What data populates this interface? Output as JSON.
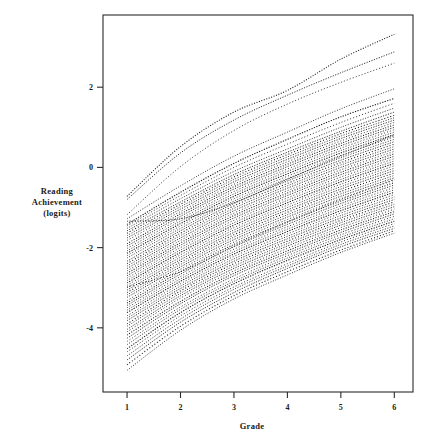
{
  "chart_data": {
    "type": "line",
    "title": "",
    "subtitle": "",
    "xlabel": "Grade",
    "ylabel": "Reading Achievement (logits)",
    "ylabel_lines": [
      "Reading",
      "Achievement",
      "(logits)"
    ],
    "xlim": [
      0.55,
      6.35
    ],
    "ylim": [
      -5.6,
      3.8
    ],
    "xticks": [
      1,
      2,
      3,
      4,
      5,
      6
    ],
    "xticklabels": [
      "1",
      "2",
      "3",
      "4",
      "5",
      "6"
    ],
    "yticks": [
      2,
      0,
      -2,
      -4
    ],
    "yticklabels": [
      "2",
      "0",
      "-2",
      "-4"
    ],
    "grid": false,
    "legend": null,
    "legend_position": "none",
    "line_style": "dotted",
    "line_color": "#111111",
    "x": [
      1,
      2,
      3,
      4,
      5,
      6
    ],
    "series": [
      {
        "name": "case-01",
        "values": [
          -0.72,
          0.52,
          1.38,
          1.92,
          2.7,
          3.32
        ]
      },
      {
        "name": "case-02",
        "values": [
          -0.8,
          0.36,
          1.18,
          1.8,
          2.36,
          2.88
        ]
      },
      {
        "name": "case-03",
        "values": [
          -1.18,
          0.02,
          0.92,
          1.58,
          2.12,
          2.6
        ]
      },
      {
        "name": "case-04",
        "values": [
          -1.28,
          -0.46,
          0.28,
          0.88,
          1.46,
          1.96
        ]
      },
      {
        "name": "case-05",
        "values": [
          -1.42,
          -0.62,
          0.1,
          0.7,
          1.26,
          1.72
        ]
      },
      {
        "name": "case-06",
        "values": [
          -1.46,
          -0.7,
          0.0,
          0.58,
          1.12,
          1.6
        ]
      },
      {
        "name": "case-07",
        "values": [
          -1.52,
          -0.78,
          -0.1,
          0.46,
          1.0,
          1.48
        ]
      },
      {
        "name": "case-08",
        "values": [
          -1.58,
          -0.86,
          -0.18,
          0.38,
          0.9,
          1.38
        ]
      },
      {
        "name": "case-09",
        "values": [
          -1.64,
          -0.92,
          -0.24,
          0.32,
          0.84,
          1.3
        ]
      },
      {
        "name": "case-10",
        "values": [
          -1.7,
          -0.98,
          -0.3,
          0.26,
          0.78,
          1.24
        ]
      },
      {
        "name": "case-11",
        "values": [
          -1.76,
          -1.04,
          -0.36,
          0.2,
          0.72,
          1.18
        ]
      },
      {
        "name": "case-12",
        "values": [
          -1.82,
          -1.1,
          -0.42,
          0.14,
          0.66,
          1.12
        ]
      },
      {
        "name": "case-13",
        "values": [
          -1.9,
          -1.16,
          -0.48,
          0.08,
          0.6,
          1.06
        ]
      },
      {
        "name": "case-14",
        "values": [
          -1.96,
          -1.22,
          -0.54,
          0.02,
          0.54,
          1.0
        ]
      },
      {
        "name": "case-15",
        "values": [
          -2.02,
          -1.28,
          -0.6,
          -0.04,
          0.48,
          0.94
        ]
      },
      {
        "name": "case-16",
        "values": [
          -2.08,
          -1.34,
          -0.66,
          -0.1,
          0.42,
          0.88
        ]
      },
      {
        "name": "case-17",
        "values": [
          -2.14,
          -1.4,
          -0.72,
          -0.16,
          0.36,
          0.82
        ]
      },
      {
        "name": "case-18",
        "values": [
          -2.2,
          -1.46,
          -0.78,
          -0.22,
          0.3,
          0.76
        ]
      },
      {
        "name": "case-19",
        "values": [
          -2.26,
          -1.52,
          -0.84,
          -0.28,
          0.24,
          0.7
        ]
      },
      {
        "name": "case-20",
        "values": [
          -2.34,
          -1.58,
          -0.9,
          -0.34,
          0.18,
          0.64
        ]
      },
      {
        "name": "case-21",
        "values": [
          -2.4,
          -1.64,
          -0.96,
          -0.4,
          0.12,
          0.58
        ]
      },
      {
        "name": "case-22",
        "values": [
          -2.46,
          -1.7,
          -1.02,
          -0.46,
          0.06,
          0.52
        ]
      },
      {
        "name": "case-23",
        "values": [
          -2.52,
          -1.76,
          -1.08,
          -0.52,
          0.0,
          0.46
        ]
      },
      {
        "name": "case-24",
        "values": [
          -2.58,
          -1.82,
          -1.14,
          -0.58,
          -0.06,
          0.4
        ]
      },
      {
        "name": "case-25",
        "values": [
          -2.64,
          -1.88,
          -1.2,
          -0.64,
          -0.12,
          0.34
        ]
      },
      {
        "name": "case-26",
        "values": [
          -2.7,
          -1.94,
          -1.26,
          -0.7,
          -0.18,
          0.28
        ]
      },
      {
        "name": "case-27",
        "values": [
          -2.76,
          -2.0,
          -1.32,
          -0.76,
          -0.24,
          0.22
        ]
      },
      {
        "name": "case-28",
        "values": [
          -2.82,
          -2.06,
          -1.38,
          -0.82,
          -0.3,
          0.16
        ]
      },
      {
        "name": "case-29",
        "values": [
          -2.88,
          -2.12,
          -1.44,
          -0.88,
          -0.36,
          0.1
        ]
      },
      {
        "name": "case-30",
        "values": [
          -2.94,
          -2.18,
          -1.5,
          -0.94,
          -0.42,
          0.04
        ]
      },
      {
        "name": "case-31",
        "values": [
          -3.0,
          -2.24,
          -1.56,
          -1.0,
          -0.48,
          -0.02
        ]
      },
      {
        "name": "case-32",
        "values": [
          -3.06,
          -2.3,
          -1.62,
          -1.06,
          -0.54,
          -0.08
        ]
      },
      {
        "name": "case-33",
        "values": [
          -3.12,
          -2.36,
          -1.68,
          -1.12,
          -0.6,
          -0.14
        ]
      },
      {
        "name": "case-34",
        "values": [
          -3.18,
          -2.42,
          -1.74,
          -1.18,
          -0.66,
          -0.2
        ]
      },
      {
        "name": "case-35",
        "values": [
          -3.24,
          -2.48,
          -1.8,
          -1.24,
          -0.72,
          -0.26
        ]
      },
      {
        "name": "case-36",
        "values": [
          -3.32,
          -2.54,
          -1.86,
          -1.3,
          -0.78,
          -0.32
        ]
      },
      {
        "name": "case-37",
        "values": [
          -3.38,
          -2.6,
          -1.92,
          -1.36,
          -0.84,
          -0.38
        ]
      },
      {
        "name": "case-38",
        "values": [
          -3.44,
          -2.66,
          -1.98,
          -1.42,
          -0.9,
          -0.44
        ]
      },
      {
        "name": "case-39",
        "values": [
          -3.5,
          -2.72,
          -2.04,
          -1.48,
          -0.96,
          -0.5
        ]
      },
      {
        "name": "case-40",
        "values": [
          -3.56,
          -2.78,
          -2.1,
          -1.54,
          -1.02,
          -0.56
        ]
      },
      {
        "name": "case-41",
        "values": [
          -3.62,
          -2.84,
          -2.16,
          -1.6,
          -1.08,
          -0.62
        ]
      },
      {
        "name": "case-42",
        "values": [
          -3.7,
          -2.9,
          -2.22,
          -1.66,
          -1.14,
          -0.68
        ]
      },
      {
        "name": "case-43",
        "values": [
          -3.76,
          -2.96,
          -2.28,
          -1.72,
          -1.2,
          -0.74
        ]
      },
      {
        "name": "case-44",
        "values": [
          -3.82,
          -3.02,
          -2.34,
          -1.78,
          -1.26,
          -0.8
        ]
      },
      {
        "name": "case-45",
        "values": [
          -3.9,
          -3.08,
          -2.4,
          -1.84,
          -1.32,
          -0.86
        ]
      },
      {
        "name": "case-46",
        "values": [
          -3.96,
          -3.14,
          -2.46,
          -1.9,
          -1.38,
          -0.92
        ]
      },
      {
        "name": "case-47",
        "values": [
          -4.04,
          -3.2,
          -2.52,
          -1.96,
          -1.44,
          -0.98
        ]
      },
      {
        "name": "case-48",
        "values": [
          -4.1,
          -3.26,
          -2.58,
          -2.02,
          -1.5,
          -1.04
        ]
      },
      {
        "name": "case-49",
        "values": [
          -4.18,
          -3.34,
          -2.64,
          -2.08,
          -1.56,
          -1.1
        ]
      },
      {
        "name": "case-50",
        "values": [
          -4.26,
          -3.4,
          -2.7,
          -2.14,
          -1.62,
          -1.16
        ]
      },
      {
        "name": "case-51",
        "values": [
          -4.34,
          -3.48,
          -2.78,
          -2.2,
          -1.68,
          -1.22
        ]
      },
      {
        "name": "case-52",
        "values": [
          -4.42,
          -3.54,
          -2.84,
          -2.26,
          -1.74,
          -1.28
        ]
      },
      {
        "name": "case-53",
        "values": [
          -4.52,
          -3.62,
          -2.9,
          -2.32,
          -1.8,
          -1.34
        ]
      },
      {
        "name": "case-54",
        "values": [
          -4.6,
          -3.7,
          -2.98,
          -2.4,
          -1.86,
          -1.4
        ]
      },
      {
        "name": "case-55",
        "values": [
          -4.7,
          -3.78,
          -3.04,
          -2.46,
          -1.92,
          -1.46
        ]
      },
      {
        "name": "case-56",
        "values": [
          -4.8,
          -3.86,
          -3.12,
          -2.52,
          -1.98,
          -1.52
        ]
      },
      {
        "name": "case-57",
        "values": [
          -4.92,
          -3.96,
          -3.2,
          -2.6,
          -2.06,
          -1.58
        ]
      },
      {
        "name": "case-58",
        "values": [
          -5.06,
          -4.06,
          -3.28,
          -2.68,
          -2.12,
          -1.64
        ]
      },
      {
        "name": "case-59",
        "values": [
          -1.34,
          -1.28,
          -0.88,
          -0.3,
          0.28,
          0.8
        ]
      },
      {
        "name": "case-60",
        "values": [
          -2.98,
          -2.6,
          -1.96,
          -1.36,
          -0.8,
          -0.3
        ]
      }
    ]
  }
}
